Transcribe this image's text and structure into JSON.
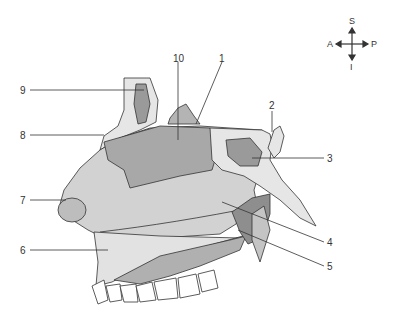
{
  "figure": {
    "labels": [
      {
        "id": "1",
        "text": "1",
        "x": 219,
        "y": 54
      },
      {
        "id": "2",
        "text": "2",
        "x": 269,
        "y": 101
      },
      {
        "id": "3",
        "text": "3",
        "x": 327,
        "y": 154
      },
      {
        "id": "4",
        "text": "4",
        "x": 327,
        "y": 238
      },
      {
        "id": "5",
        "text": "5",
        "x": 327,
        "y": 262
      },
      {
        "id": "6",
        "text": "6",
        "x": 20,
        "y": 246
      },
      {
        "id": "7",
        "text": "7",
        "x": 20,
        "y": 196
      },
      {
        "id": "8",
        "text": "8",
        "x": 20,
        "y": 131
      },
      {
        "id": "9",
        "text": "9",
        "x": 20,
        "y": 86
      },
      {
        "id": "10",
        "text": "10",
        "x": 173,
        "y": 54
      }
    ],
    "compass": {
      "superior": "S",
      "inferior": "I",
      "anterior": "A",
      "posterior": "P"
    },
    "colors": {
      "bone_light": "#e6e6e6",
      "tissue_mid": "#c8c8c8",
      "sinus_dark": "#9a9a9a",
      "outline": "#333333",
      "background": "#ffffff"
    }
  }
}
